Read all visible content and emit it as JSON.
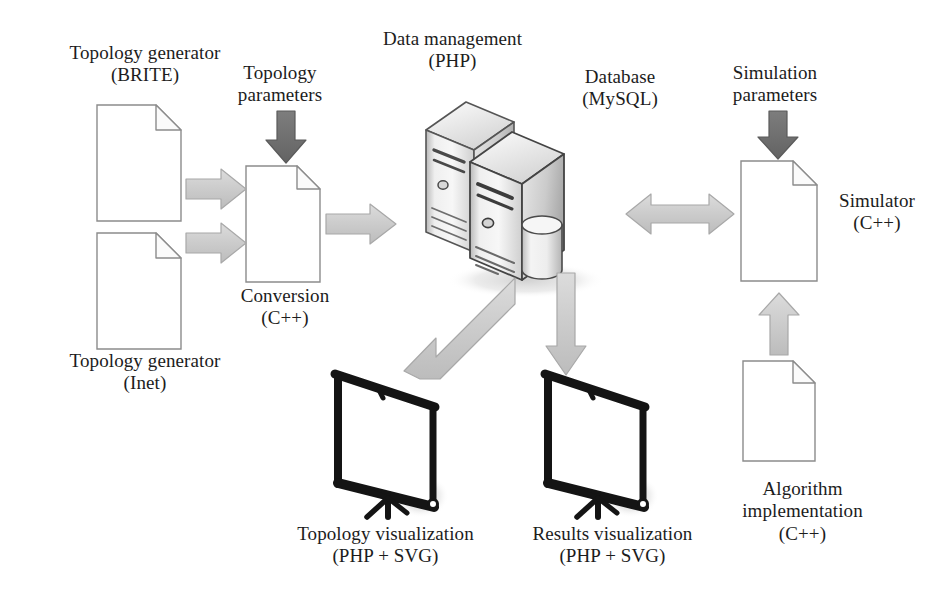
{
  "diagram": {
    "title": "Network simulation platform architecture",
    "type": "block-diagram",
    "canvas": {
      "width": 950,
      "height": 593
    },
    "background_color": "#ffffff",
    "palette": {
      "text": "#1c1c1c",
      "document_outline": "#8c8c8c",
      "arrow_light_fill": "#d2d2d2",
      "arrow_light_stroke": "#a8a8a8",
      "arrow_dark_fill": "#6e6e6e",
      "arrow_dark_stroke": "#5a5a5a",
      "server_light": "#f2f2f2",
      "server_mid": "#d8d8d8",
      "server_dark": "#9a9a9a",
      "screen_frame": "#1a1a1a",
      "screen_face": "#ffffff",
      "shadow": "#e8e8e8"
    }
  },
  "nodes": [
    {
      "id": "topology-generator-brite",
      "icon": "document-icon",
      "label": "Topology generator\n(BRITE)",
      "label_position": "above"
    },
    {
      "id": "topology-generator-inet",
      "icon": "document-icon",
      "label": "Topology generator\n(Inet)",
      "label_position": "below"
    },
    {
      "id": "conversion",
      "icon": "document-icon",
      "label": "Conversion\n(C++)",
      "label_position": "below"
    },
    {
      "id": "data-management",
      "icon": "server-icon",
      "label": "Data management\n(PHP)",
      "label_position": "above"
    },
    {
      "id": "database",
      "icon": "database-server-icon",
      "label": "Database\n(MySQL)",
      "label_position": "above-right"
    },
    {
      "id": "simulator",
      "icon": "document-icon",
      "label": "Simulator\n(C++)",
      "label_position": "right"
    },
    {
      "id": "algorithm-implementation",
      "icon": "document-icon",
      "label": "Algorithm\nimplementation\n(C++)",
      "label_position": "below"
    },
    {
      "id": "topology-visualization",
      "icon": "presentation-screen-icon",
      "label": "Topology visualization\n(PHP + SVG)",
      "label_position": "below"
    },
    {
      "id": "results-visualization",
      "icon": "presentation-screen-icon",
      "label": "Results visualization\n(PHP + SVG)",
      "label_position": "below"
    }
  ],
  "annotations": [
    {
      "id": "topology-parameters",
      "label": "Topology\nparameters",
      "attached_arrow": "arrow-topology-parameters"
    },
    {
      "id": "simulation-parameters",
      "label": "Simulation\nparameters",
      "attached_arrow": "arrow-simulation-parameters"
    }
  ],
  "arrows": [
    {
      "id": "arrow-brite-to-conversion",
      "from": "topology-generator-brite",
      "to": "conversion",
      "direction": "right",
      "style": "light"
    },
    {
      "id": "arrow-inet-to-conversion",
      "from": "topology-generator-inet",
      "to": "conversion",
      "direction": "right",
      "style": "light"
    },
    {
      "id": "arrow-topology-parameters",
      "from": "topology-parameters",
      "to": "conversion",
      "direction": "down",
      "style": "dark"
    },
    {
      "id": "arrow-conversion-to-server",
      "from": "conversion",
      "to": "data-management",
      "direction": "right",
      "style": "light"
    },
    {
      "id": "arrow-server-to-topology-viz",
      "from": "data-management",
      "to": "topology-visualization",
      "direction": "down-left-diagonal",
      "style": "light"
    },
    {
      "id": "arrow-server-to-results-viz",
      "from": "database",
      "to": "results-visualization",
      "direction": "down",
      "style": "light"
    },
    {
      "id": "arrow-server-simulator",
      "from": "database",
      "to": "simulator",
      "direction": "bidirectional-horizontal",
      "style": "light"
    },
    {
      "id": "arrow-simulation-parameters",
      "from": "simulation-parameters",
      "to": "simulator",
      "direction": "down",
      "style": "dark"
    },
    {
      "id": "arrow-algorithm-to-simulator",
      "from": "algorithm-implementation",
      "to": "simulator",
      "direction": "up",
      "style": "light"
    }
  ],
  "labels": {
    "topology_generator_brite": "Topology generator\n(BRITE)",
    "topology_generator_inet": "Topology generator\n(Inet)",
    "topology_parameters": "Topology\nparameters",
    "conversion": "Conversion\n(C++)",
    "data_management": "Data management\n(PHP)",
    "database": "Database\n(MySQL)",
    "simulation_parameters": "Simulation\nparameters",
    "simulator": "Simulator\n(C++)",
    "algorithm_implementation": "Algorithm\nimplementation\n(C++)",
    "topology_visualization": "Topology visualization\n(PHP + SVG)",
    "results_visualization": "Results visualization\n(PHP + SVG)"
  }
}
